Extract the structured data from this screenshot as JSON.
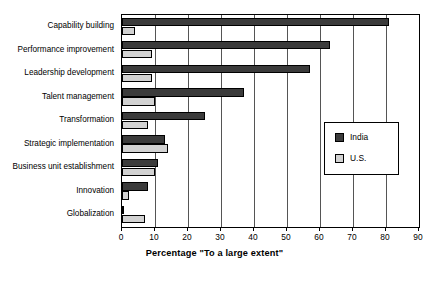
{
  "chart_data": {
    "type": "bar",
    "orientation": "horizontal",
    "title": "",
    "xlabel": "Percentage \"To a large extent\"",
    "ylabel": "",
    "xlim": [
      0,
      90
    ],
    "xticks": [
      0,
      10,
      20,
      30,
      40,
      50,
      60,
      70,
      80,
      90
    ],
    "grid": "vertical",
    "legend_position": "middle-right",
    "categories": [
      "Capability building",
      "Performance improvement",
      "Leadership development",
      "Talent management",
      "Transformation",
      "Strategic implementation",
      "Business unit establishment",
      "Innovation",
      "Globalization"
    ],
    "series": [
      {
        "name": "India",
        "color": "#3b3b3b",
        "values": [
          81,
          63,
          57,
          37,
          25,
          13,
          11,
          8,
          0.3
        ]
      },
      {
        "name": "U.S.",
        "color": "#d2d2d2",
        "values": [
          4,
          9,
          9,
          10,
          8,
          14,
          10,
          2,
          7
        ]
      }
    ]
  },
  "legend": {
    "entries": [
      {
        "label": "India",
        "swatch": "india"
      },
      {
        "label": "U.S.",
        "swatch": "us"
      }
    ]
  },
  "axis": {
    "x_title": "Percentage \"To a large extent\"",
    "x_tick_labels": [
      "0",
      "10",
      "20",
      "30",
      "40",
      "50",
      "60",
      "70",
      "80",
      "90"
    ]
  }
}
